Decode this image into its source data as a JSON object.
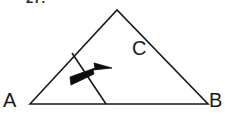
{
  "figure": {
    "kind": "geometry-diagram",
    "problem_number": "27.",
    "background_color": "#ffffff",
    "stroke_color": "#1a1a1a",
    "labels": {
      "vertex_a": "A",
      "vertex_b": "B",
      "region_c": "C"
    },
    "vertices": {
      "a": {
        "x": 30,
        "y": 104
      },
      "b": {
        "x": 208,
        "y": 104
      },
      "apex": {
        "x": 117,
        "y": 10
      }
    },
    "cut_line": {
      "start": {
        "x": 72,
        "y": 53
      },
      "end": {
        "x": 106,
        "y": 104
      }
    },
    "arrow": {
      "tail": {
        "x": 72,
        "y": 81
      },
      "tip": {
        "x": 110,
        "y": 68
      },
      "direction": "right-and-up"
    }
  }
}
